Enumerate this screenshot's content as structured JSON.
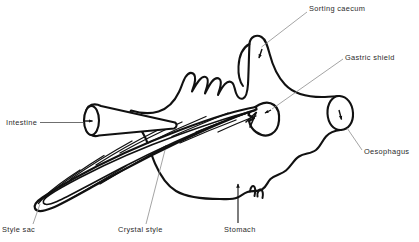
{
  "figure": {
    "type": "line-drawing",
    "background_color": "#ffffff",
    "ink_color": "#111111",
    "leader_color": "#8a8a8a",
    "labels": [
      {
        "id": "sorting-caecum",
        "text": "Sorting caecum"
      },
      {
        "id": "gastric-shield",
        "text": "Gastric shield"
      },
      {
        "id": "oesophagus",
        "text": "Oesophagus"
      },
      {
        "id": "intestine",
        "text": "Intestine"
      },
      {
        "id": "style-sac",
        "text": "Style sac"
      },
      {
        "id": "crystal-style",
        "text": "Crystal style"
      },
      {
        "id": "stomach",
        "text": "Stomach"
      }
    ]
  }
}
